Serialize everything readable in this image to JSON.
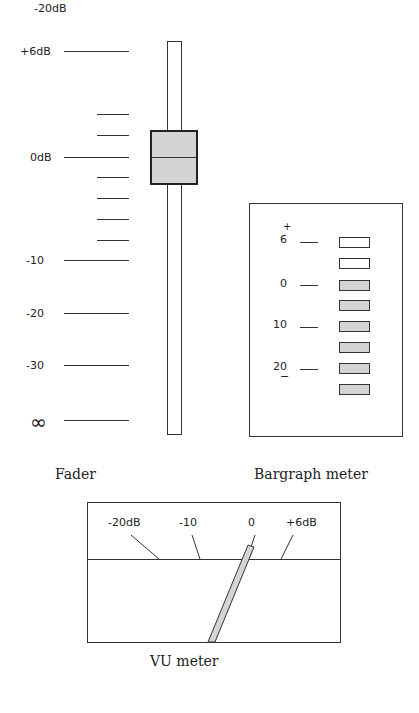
{
  "header": {
    "cut_label": "-20dB"
  },
  "fader": {
    "caption": "Fader",
    "scale_labels": [
      {
        "text": "+6dB",
        "y": 51
      },
      {
        "text": "0dB",
        "y": 157
      },
      {
        "text": "-10",
        "y": 260
      },
      {
        "text": "-20",
        "y": 313
      },
      {
        "text": "-30",
        "y": 365
      },
      {
        "text": "∞",
        "y": 420
      }
    ],
    "position_db": "0dB",
    "knob_color": "#d4d4d4"
  },
  "bargraph": {
    "caption": "Bargraph meter",
    "plus": "+",
    "minus": "−",
    "labels": [
      {
        "text": "6",
        "index": 0
      },
      {
        "text": "0",
        "index": 2
      },
      {
        "text": "10",
        "index": 4
      },
      {
        "text": "20",
        "index": 6
      }
    ],
    "segments": [
      "off",
      "off",
      "on",
      "on",
      "on",
      "on",
      "on",
      "on"
    ],
    "on_color": "#d4d4d4",
    "off_color": "#ffffff"
  },
  "vu": {
    "caption": "VU meter",
    "labels": [
      "-20dB",
      "-10",
      "0",
      "+6dB"
    ],
    "needle_color": "#d4d4d4"
  }
}
